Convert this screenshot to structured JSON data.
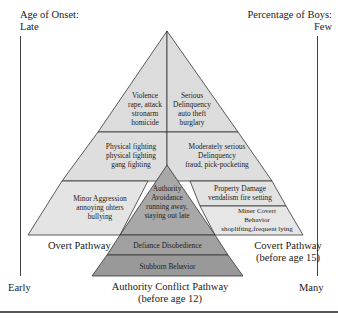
{
  "axes": {
    "left_top_label_line1": "Age of Onset:",
    "left_top_label_line2": "Late",
    "left_bottom_label": "Early",
    "right_top_label_line1": "Percentage of Boys:",
    "right_top_label_line2": "Few",
    "right_bottom_label": "Many"
  },
  "overt": {
    "top": [
      "Violence",
      "rape, attack",
      "stronarm",
      "homicide"
    ],
    "middle": [
      "Physical fighting",
      "physical fighting",
      "gang fighting"
    ],
    "bottom": [
      "Minor Aggression",
      "annoying ohters",
      "bullying"
    ],
    "pathway_label": "Overt Pathway"
  },
  "covert": {
    "top": [
      "Serious",
      "Delinquency",
      "auto theft",
      "burglary"
    ],
    "middle": [
      "Moderately serious",
      "Delinquency",
      "fraud, pick-pocketing"
    ],
    "lower": [
      "Property Damage",
      "vendalism fire setting"
    ],
    "bottom": [
      "Miner Covert",
      "Behavior",
      "shoplifting,frequent lying"
    ],
    "pathway_label_line1": "Covert Pathway",
    "pathway_label_line2": "(before age 15)"
  },
  "authority": {
    "top": [
      "Authority",
      "Avoidance",
      "running away,",
      "staying out late"
    ],
    "middle": "Defiance Disobedience",
    "bottom": "Stubborn Behavior",
    "pathway_label_line1": "Authority Conflict Pathway",
    "pathway_label_line2": "(before age 12)"
  },
  "colors": {
    "outer_fill": "#dcdcdc",
    "outer_lower_fill": "#e4e4e4",
    "authority_fill": "#a8a8a8",
    "authority_lower_fill": "#999999",
    "stroke": "#333333"
  }
}
